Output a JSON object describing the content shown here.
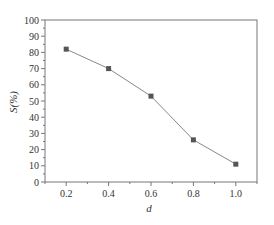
{
  "chart_data": {
    "type": "line",
    "title": "",
    "xlabel": "d",
    "ylabel": "S(%)",
    "x": [
      0.2,
      0.4,
      0.6,
      0.8,
      1.0
    ],
    "series": [
      {
        "name": "S",
        "values": [
          82,
          70,
          53,
          26,
          11
        ],
        "marker": "square",
        "color": "#555555"
      }
    ],
    "xlim": [
      0.1,
      1.1
    ],
    "ylim": [
      0,
      100
    ],
    "xticks": [
      0.2,
      0.4,
      0.6,
      0.8,
      1.0
    ],
    "xtick_labels": [
      "0.2",
      "0.4",
      "0.6",
      "0.8",
      "1.0"
    ],
    "yticks": [
      0,
      10,
      20,
      30,
      40,
      50,
      60,
      70,
      80,
      90,
      100
    ],
    "ytick_labels": [
      "0",
      "10",
      "20",
      "30",
      "40",
      "50",
      "60",
      "70",
      "80",
      "90",
      "100"
    ],
    "minor_ticks": true,
    "grid": false,
    "legend": null,
    "frame": "box"
  }
}
